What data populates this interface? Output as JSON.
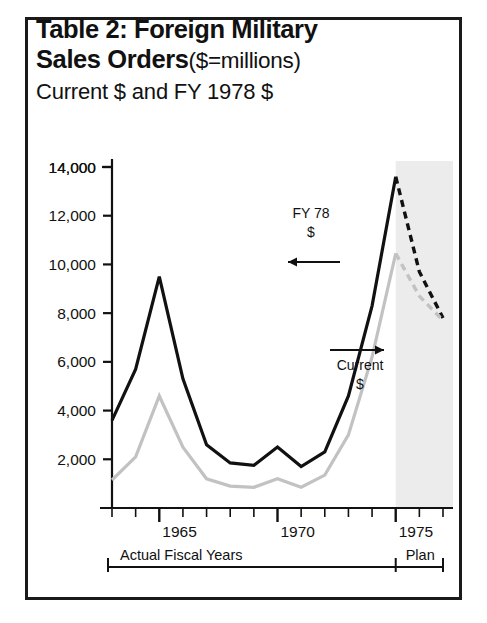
{
  "figure": {
    "title_line1": "Table 2: Foreign Military",
    "title_line2_bold": "Sales Orders",
    "title_line2_rest": "($=millions)",
    "title_line3": "Current $ and FY 1978 $"
  },
  "annotations": {
    "series_black_label_line1": "FY 78",
    "series_black_label_line2": "$",
    "series_gray_label_line1": "Current",
    "series_gray_label_line2": "$",
    "bracket_actual": "Actual Fiscal Years",
    "bracket_plan": "Plan"
  },
  "colors": {
    "series_black": "#111111",
    "series_gray": "#c2c2c2",
    "plan_shading": "#ececec",
    "frame": "#1a1a1a",
    "axis": "#111111"
  },
  "chart_data": {
    "type": "line",
    "subtitle": "Current $ and FY 1978 $",
    "xlabel": "Actual Fiscal Years",
    "ylabel": "",
    "x": [
      1963,
      1964,
      1965,
      1966,
      1967,
      1968,
      1969,
      1970,
      1971,
      1972,
      1973,
      1974,
      1975,
      1976,
      1977
    ],
    "xlim": [
      1963,
      1977
    ],
    "ylim": [
      0,
      14000
    ],
    "yticks": [
      2000,
      4000,
      6000,
      8000,
      10000,
      12000,
      14000
    ],
    "ytick_labels": [
      "2,000",
      "4,000",
      "6,000",
      "8,000",
      "10,000",
      "12,000",
      "14,000"
    ],
    "xticks": [
      1963,
      1964,
      1965,
      1966,
      1967,
      1968,
      1969,
      1970,
      1971,
      1972,
      1973,
      1974,
      1975,
      1976,
      1977
    ],
    "xtick_labels": [
      "",
      "",
      "1965",
      "",
      "",
      "",
      "",
      "1970",
      "",
      "",
      "",
      "",
      "1975",
      "",
      ""
    ],
    "grid": false,
    "legend_position": "inline-annotations",
    "plan_region_start": 1975,
    "plan_region_label": "Plan",
    "series": [
      {
        "name": "FY 78 $",
        "color": "#111111",
        "style": "solid",
        "dashed_from": 1975,
        "values": [
          3600,
          5700,
          9500,
          5300,
          2600,
          1850,
          1750,
          2500,
          1700,
          2300,
          4600,
          8300,
          13600,
          9700,
          7800
        ]
      },
      {
        "name": "Current $",
        "color": "#c2c2c2",
        "style": "solid",
        "dashed_from": 1975,
        "values": [
          1150,
          2100,
          4600,
          2500,
          1200,
          900,
          850,
          1200,
          850,
          1350,
          3000,
          6200,
          10450,
          8700,
          7700
        ]
      }
    ]
  }
}
